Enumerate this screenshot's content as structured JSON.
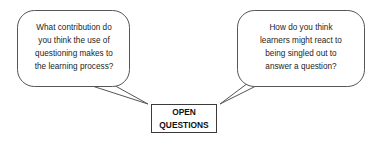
{
  "diagram": {
    "type": "speech-bubble-diagram",
    "background_color": "#ffffff",
    "central_node": {
      "label": "OPEN\nQUESTIONS",
      "line1": "OPEN",
      "line2": "QUESTIONS",
      "shape": "rectangle",
      "border_color": "#3a3a3a",
      "fill_color": "#ffffff"
    },
    "bubbles": [
      {
        "id": "left",
        "text": "What contribution do\nyou think the use of\nquestioning makes to\nthe learning process?",
        "shape": "rounded-rectangle-callout",
        "tail_direction": "down-right",
        "border_color": "#555555",
        "fill_color": "#ffffff"
      },
      {
        "id": "right",
        "text": "How do you think\nlearners might react to\nbeing singled out to\nanswer a question?",
        "shape": "rounded-rectangle-callout",
        "tail_direction": "down-left",
        "border_color": "#555555",
        "fill_color": "#ffffff"
      }
    ]
  }
}
